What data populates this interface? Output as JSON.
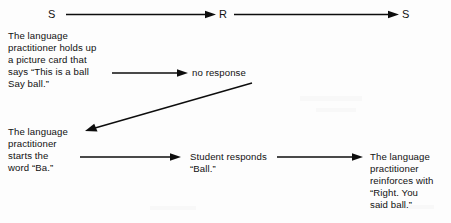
{
  "diagram": {
    "stroke_color": "#0d0d0d",
    "text_color": "#111111",
    "background_color": "#fdfdfd",
    "top_row": {
      "stimulus_left": "S",
      "response": "R",
      "stimulus_right": "S"
    },
    "blocks": {
      "prompt_card": "The language\npractitioner holds up\na picture card that\nsays “This is a ball\nSay ball.”",
      "no_response": "no response",
      "prompt_ba": "The language\npractitioner\nstarts the\nword “Ba.”",
      "student_responds": "Student responds\n“Ball.”",
      "reinforcement": "The language\npractitioner\nreinforces with\n“Right. You\nsaid ball.”"
    },
    "connectors": [
      {
        "name": "s-to-r",
        "label": ""
      },
      {
        "name": "r-to-s",
        "label": ""
      },
      {
        "name": "prompt-card-to-no-response",
        "label": ""
      },
      {
        "name": "no-response-to-prompt-ba",
        "label": ""
      },
      {
        "name": "prompt-ba-to-student-responds",
        "label": ""
      },
      {
        "name": "student-responds-to-reinforcement",
        "label": ""
      }
    ]
  }
}
